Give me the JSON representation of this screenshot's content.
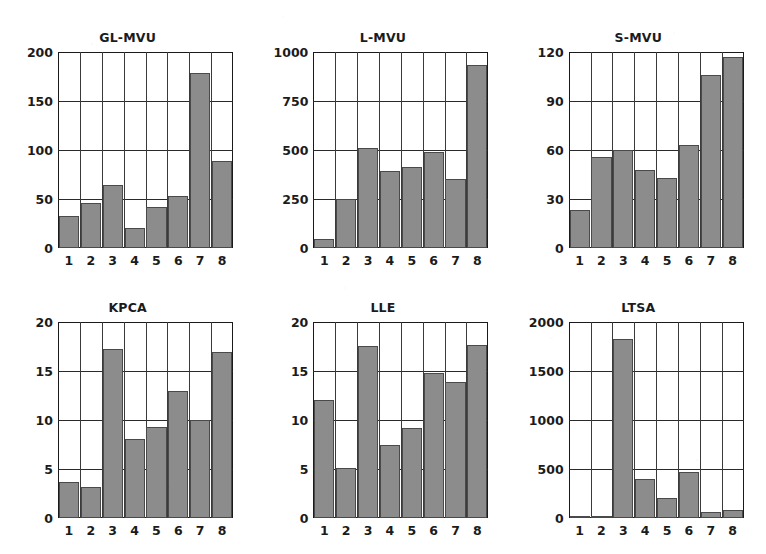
{
  "figure": {
    "panel_count": 6,
    "bar_color": "#8c8c8c",
    "bar_edge_color": "#4a4a4a",
    "axis_color": "#1a1a1a",
    "background_color": "#ffffff",
    "grid": true,
    "layout": "2 rows x 3 columns"
  },
  "chart_data": [
    {
      "type": "bar",
      "title": "GL-MVU",
      "xlabel": "",
      "ylabel": "",
      "categories": [
        "1",
        "2",
        "3",
        "4",
        "5",
        "6",
        "7",
        "8"
      ],
      "values": [
        33,
        46,
        64,
        20,
        42,
        53,
        179,
        89
      ],
      "ylim": [
        0,
        200
      ],
      "yticks": [
        0,
        50,
        100,
        150,
        200
      ],
      "ytick_labels": [
        "0",
        "50",
        "100",
        "150",
        "200"
      ],
      "grid": true,
      "legend": null
    },
    {
      "type": "bar",
      "title": "L-MVU",
      "xlabel": "",
      "ylabel": "",
      "categories": [
        "1",
        "2",
        "3",
        "4",
        "5",
        "6",
        "7",
        "8"
      ],
      "values": [
        45,
        252,
        508,
        392,
        415,
        490,
        352,
        935
      ],
      "ylim": [
        0,
        1000
      ],
      "yticks": [
        0,
        250,
        500,
        750,
        1000
      ],
      "ytick_labels": [
        "0",
        "250",
        "500",
        "750",
        "1000"
      ],
      "grid": true,
      "legend": null
    },
    {
      "type": "bar",
      "title": "S-MVU",
      "xlabel": "",
      "ylabel": "",
      "categories": [
        "1",
        "2",
        "3",
        "4",
        "5",
        "6",
        "7",
        "8"
      ],
      "values": [
        23,
        56,
        60,
        48,
        43,
        63,
        106,
        117
      ],
      "ylim": [
        0,
        120
      ],
      "yticks": [
        0,
        30,
        60,
        90,
        120
      ],
      "ytick_labels": [
        "0",
        "30",
        "60",
        "90",
        "120"
      ],
      "grid": true,
      "legend": null
    },
    {
      "type": "bar",
      "title": "KPCA",
      "xlabel": "",
      "ylabel": "",
      "categories": [
        "1",
        "2",
        "3",
        "4",
        "5",
        "6",
        "7",
        "8"
      ],
      "values": [
        3.7,
        3.2,
        17.2,
        8.1,
        9.3,
        13.0,
        10.0,
        16.9
      ],
      "ylim": [
        0,
        20
      ],
      "yticks": [
        0,
        5,
        10,
        15,
        20
      ],
      "ytick_labels": [
        "0",
        "5",
        "10",
        "15",
        "20"
      ],
      "grid": true,
      "legend": null
    },
    {
      "type": "bar",
      "title": "LLE",
      "xlabel": "",
      "ylabel": "",
      "categories": [
        "1",
        "2",
        "3",
        "4",
        "5",
        "6",
        "7",
        "8"
      ],
      "values": [
        12.0,
        5.1,
        17.6,
        7.5,
        9.2,
        14.8,
        13.9,
        17.7
      ],
      "ylim": [
        0,
        20
      ],
      "yticks": [
        0,
        5,
        10,
        15,
        20
      ],
      "ytick_labels": [
        "0",
        "5",
        "10",
        "15",
        "20"
      ],
      "grid": true,
      "legend": null
    },
    {
      "type": "bar",
      "title": "LTSA",
      "xlabel": "",
      "ylabel": "",
      "categories": [
        "1",
        "2",
        "3",
        "4",
        "5",
        "6",
        "7",
        "8"
      ],
      "values": [
        10,
        12,
        1825,
        395,
        200,
        465,
        60,
        85
      ],
      "ylim": [
        0,
        2000
      ],
      "yticks": [
        0,
        500,
        1000,
        1500,
        2000
      ],
      "ytick_labels": [
        "0",
        "500",
        "1000",
        "1500",
        "2000"
      ],
      "grid": true,
      "legend": null
    }
  ]
}
